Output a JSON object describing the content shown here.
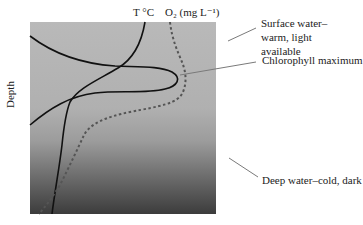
{
  "diagram": {
    "title": "",
    "axis_labels": {
      "temperature": "T °C",
      "oxygen": "O₂ (mg L⁻¹)",
      "depth": "Depth"
    },
    "annotations": {
      "surface": "Surface water–warm, light available",
      "chlorophyll": "Chlorophyll maximum",
      "deep": "Deep water–cold, dark"
    },
    "curves": [
      {
        "name": "temperature",
        "style": "solid",
        "color": "#111111"
      },
      {
        "name": "oxygen",
        "style": "dotted",
        "color": "#555555"
      },
      {
        "name": "chlorophyll",
        "style": "solid",
        "color": "#111111"
      }
    ],
    "background_gradient": {
      "top": "#b8b8b8",
      "middle": "#a8a8a8",
      "bottom": "#3a3a3a"
    },
    "leader_color": "#777777"
  }
}
